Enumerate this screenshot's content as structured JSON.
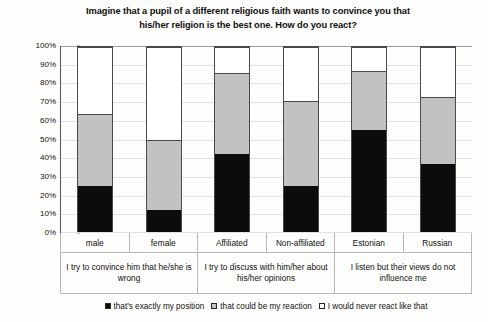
{
  "chart_data": {
    "type": "bar",
    "stacked": true,
    "normalized": true,
    "title": "Imagine that a pupil of a different religious faith wants to convince you that his/her religion is the best one. How do you react?",
    "title_lines": [
      "Imagine that a pupil of a different religious faith wants to convince you that",
      "his/her religion is the best one. How do you react?"
    ],
    "xlabel": "",
    "ylabel": "",
    "ylim": [
      0,
      100
    ],
    "ytick_labels": [
      "0%",
      "10%",
      "20%",
      "30%",
      "40%",
      "50%",
      "60%",
      "70%",
      "80%",
      "90%",
      "100%"
    ],
    "ytick_values": [
      0,
      10,
      20,
      30,
      40,
      50,
      60,
      70,
      80,
      90,
      100
    ],
    "grid": true,
    "legend_position": "bottom",
    "categories": [
      "male",
      "female",
      "Affiliated",
      "Non-affiliated",
      "Estonian",
      "Russian"
    ],
    "group_labels": [
      "I try to convince him that he/she is wrong",
      "I try to discuss with him/her about his/her opinions",
      "I listen but their views do not influence me"
    ],
    "group_spans": [
      2,
      2,
      2
    ],
    "series": [
      {
        "name": "that's exactly my position",
        "color": "#0c0c0c",
        "values": [
          25,
          12,
          42,
          25,
          55,
          37
        ]
      },
      {
        "name": "that could be my reaction",
        "color": "#c2c2c2",
        "values": [
          39,
          38,
          44,
          46,
          32,
          36
        ]
      },
      {
        "name": "I would never react like that",
        "color": "#ffffff",
        "values": [
          36,
          50,
          14,
          29,
          13,
          27
        ]
      }
    ]
  }
}
